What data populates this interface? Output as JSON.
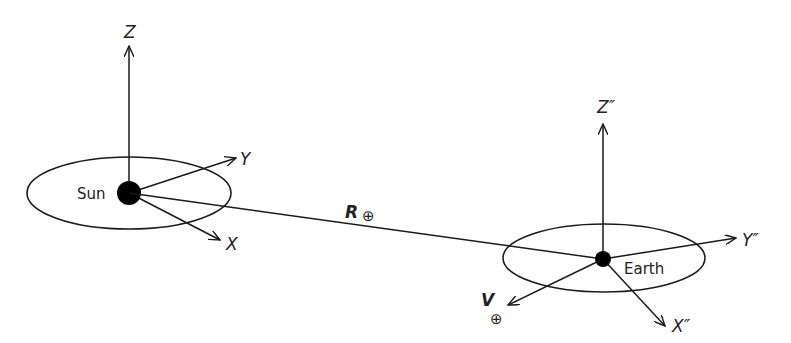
{
  "diagram": {
    "type": "heliocentric-geocentric-frames",
    "colors": {
      "stroke": "#1a1a1a",
      "fill": "#000000",
      "text": "#222222"
    },
    "sun": {
      "label": "Sun",
      "axes": {
        "z": "Z",
        "y": "Y",
        "x": "X"
      }
    },
    "earth": {
      "label": "Earth",
      "axes": {
        "z": "Z″",
        "y": "Y″",
        "x": "X″"
      }
    },
    "vectors": {
      "position": {
        "symbol": "R",
        "subscript": "⊕"
      },
      "velocity": {
        "symbol": "V",
        "subscript": "⊕"
      }
    }
  }
}
